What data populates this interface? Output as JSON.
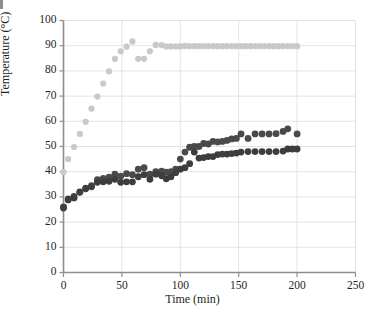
{
  "chart_data": {
    "type": "scatter",
    "title": "",
    "xlabel": "Time (min)",
    "ylabel": "Temperature (°C)",
    "xlim": [
      0,
      250
    ],
    "ylim": [
      0,
      100
    ],
    "xticks": [
      0,
      50,
      100,
      150,
      200,
      250
    ],
    "yticks": [
      0,
      10,
      20,
      30,
      40,
      50,
      60,
      70,
      80,
      90,
      100
    ],
    "grid": "horizontal-and-vertical",
    "legend": "none",
    "colors": {
      "series_light": "#c9c9c9",
      "series_dark_upper": "#4a4a4a",
      "series_dark_lower": "#3d3d3d",
      "axis": "#8e8e8e",
      "grid": "#dcdcdc",
      "text": "#231f20"
    },
    "series": [
      {
        "name": "Heating bath temperature",
        "marker": "circle",
        "color": "#c9c9c9",
        "radius": 3.1,
        "points": [
          [
            0,
            39.8
          ],
          [
            4,
            45.0
          ],
          [
            9,
            49.8
          ],
          [
            14,
            55.0
          ],
          [
            19,
            59.8
          ],
          [
            24,
            65.0
          ],
          [
            29,
            69.8
          ],
          [
            34,
            75.0
          ],
          [
            39,
            79.8
          ],
          [
            44,
            84.8
          ],
          [
            49,
            87.8
          ],
          [
            54,
            89.6
          ],
          [
            59,
            91.7
          ],
          [
            64,
            84.8
          ],
          [
            69,
            84.8
          ],
          [
            74,
            87.8
          ],
          [
            79,
            90.3
          ],
          [
            84,
            90.2
          ],
          [
            88,
            89.7
          ],
          [
            92,
            89.7
          ],
          [
            96,
            89.7
          ],
          [
            100,
            89.7
          ],
          [
            104,
            89.9
          ],
          [
            108,
            89.8
          ],
          [
            112,
            89.8
          ],
          [
            116,
            89.8
          ],
          [
            120,
            89.8
          ],
          [
            124,
            89.8
          ],
          [
            128,
            89.8
          ],
          [
            132,
            89.8
          ],
          [
            136,
            89.8
          ],
          [
            140,
            89.8
          ],
          [
            144,
            89.8
          ],
          [
            148,
            89.8
          ],
          [
            152,
            89.8
          ],
          [
            156,
            89.8
          ],
          [
            160,
            89.8
          ],
          [
            164,
            89.8
          ],
          [
            168,
            89.8
          ],
          [
            172,
            89.8
          ],
          [
            176,
            89.8
          ],
          [
            180,
            89.8
          ],
          [
            184,
            89.8
          ],
          [
            188,
            89.8
          ],
          [
            192,
            89.8
          ],
          [
            196,
            89.8
          ],
          [
            200,
            89.8
          ]
        ]
      },
      {
        "name": "Reactor temperature (upper)",
        "marker": "circle",
        "color": "#4a4a4a",
        "radius": 3.4,
        "points": [
          [
            0,
            26.0
          ],
          [
            4,
            29.2
          ],
          [
            9,
            30.2
          ],
          [
            14,
            32.0
          ],
          [
            19,
            33.5
          ],
          [
            24,
            34.5
          ],
          [
            29,
            36.8
          ],
          [
            34,
            37.3
          ],
          [
            39,
            37.8
          ],
          [
            44,
            39.0
          ],
          [
            49,
            38.2
          ],
          [
            54,
            39.2
          ],
          [
            59,
            38.8
          ],
          [
            64,
            41.0
          ],
          [
            69,
            41.6
          ],
          [
            74,
            39.0
          ],
          [
            79,
            40.0
          ],
          [
            84,
            40.2
          ],
          [
            88,
            39.8
          ],
          [
            92,
            40.0
          ],
          [
            96,
            41.0
          ],
          [
            100,
            45.0
          ],
          [
            104,
            47.8
          ],
          [
            108,
            49.7
          ],
          [
            112,
            50.0
          ],
          [
            116,
            50.0
          ],
          [
            120,
            51.2
          ],
          [
            124,
            51.0
          ],
          [
            128,
            52.0
          ],
          [
            132,
            51.8
          ],
          [
            136,
            52.0
          ],
          [
            140,
            52.4
          ],
          [
            144,
            53.0
          ],
          [
            148,
            53.2
          ],
          [
            152,
            55.0
          ],
          [
            158,
            53.2
          ],
          [
            164,
            55.0
          ],
          [
            170,
            55.0
          ],
          [
            176,
            55.0
          ],
          [
            182,
            55.1
          ],
          [
            188,
            56.0
          ],
          [
            192,
            57.0
          ],
          [
            200,
            55.0
          ]
        ]
      },
      {
        "name": "Reactor temperature (lower)",
        "marker": "circle",
        "color": "#3d3d3d",
        "radius": 3.4,
        "points": [
          [
            0,
            25.6
          ],
          [
            4,
            28.8
          ],
          [
            9,
            29.6
          ],
          [
            14,
            31.8
          ],
          [
            19,
            33.2
          ],
          [
            24,
            34.0
          ],
          [
            29,
            35.8
          ],
          [
            34,
            36.0
          ],
          [
            39,
            36.2
          ],
          [
            44,
            37.0
          ],
          [
            49,
            35.8
          ],
          [
            54,
            36.0
          ],
          [
            59,
            36.0
          ],
          [
            64,
            38.0
          ],
          [
            69,
            38.8
          ],
          [
            74,
            37.0
          ],
          [
            79,
            39.0
          ],
          [
            84,
            38.4
          ],
          [
            88,
            37.2
          ],
          [
            92,
            38.0
          ],
          [
            96,
            39.6
          ],
          [
            100,
            41.0
          ],
          [
            104,
            41.6
          ],
          [
            108,
            43.2
          ],
          [
            112,
            47.8
          ],
          [
            116,
            45.4
          ],
          [
            120,
            45.6
          ],
          [
            124,
            46.0
          ],
          [
            128,
            46.0
          ],
          [
            132,
            46.8
          ],
          [
            136,
            47.0
          ],
          [
            140,
            47.0
          ],
          [
            144,
            47.2
          ],
          [
            148,
            47.4
          ],
          [
            152,
            47.8
          ],
          [
            158,
            48.0
          ],
          [
            164,
            48.0
          ],
          [
            170,
            48.0
          ],
          [
            176,
            48.0
          ],
          [
            182,
            48.0
          ],
          [
            188,
            48.2
          ],
          [
            192,
            49.0
          ],
          [
            196,
            49.0
          ],
          [
            200,
            49.0
          ]
        ]
      }
    ]
  },
  "axis_labels": {
    "x_title": "Time (min)",
    "y_title": "Temperature (°C)",
    "x_ticks": [
      "0",
      "50",
      "100",
      "150",
      "200",
      "250"
    ],
    "y_ticks": [
      "0",
      "10",
      "20",
      "30",
      "40",
      "50",
      "60",
      "70",
      "80",
      "90",
      "100"
    ]
  }
}
